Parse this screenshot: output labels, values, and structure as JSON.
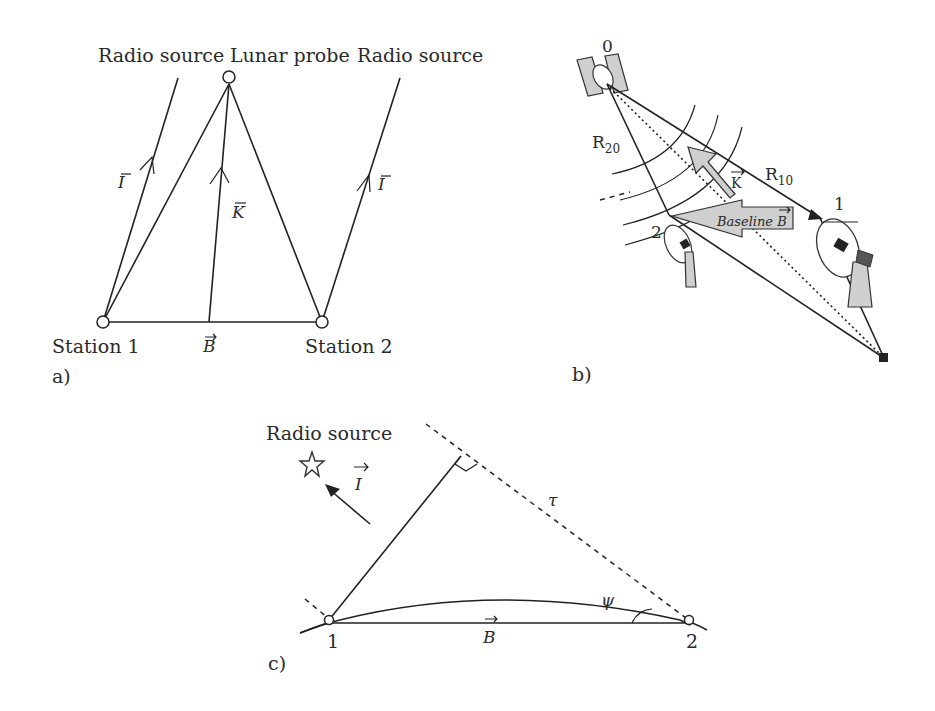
{
  "panel_a": {
    "caption": "a)",
    "labels": {
      "radio_source_left": "Radio source",
      "lunar_probe": "Lunar probe",
      "radio_source_right": "Radio source",
      "station_1": "Station 1",
      "station_2": "Station 2",
      "vector_I_left": "I",
      "vector_I_right": "I",
      "vector_K": "K",
      "vector_B": "B"
    }
  },
  "panel_b": {
    "caption": "b)",
    "labels": {
      "point_0": "0",
      "point_1": "1",
      "point_2": "2",
      "range_R20": "R",
      "range_R20_sub": "20",
      "range_R10": "R",
      "range_R10_sub": "10",
      "vector_K": "K",
      "baseline": "Baseline B"
    }
  },
  "panel_c": {
    "caption": "c)",
    "labels": {
      "radio_source": "Radio source",
      "vector_I": "I",
      "delay_tau": "τ",
      "angle_psi": "ψ",
      "vector_B": "B",
      "point_1": "1",
      "point_2": "2"
    }
  },
  "colors": {
    "ink": "#222222",
    "fill_gray": "#cfcfcf",
    "background": "#ffffff"
  }
}
